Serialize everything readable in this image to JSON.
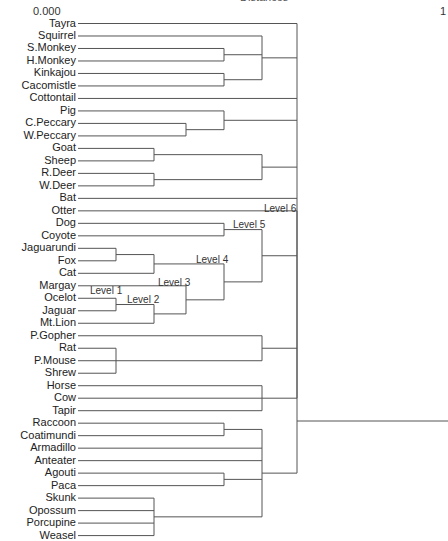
{
  "title": "Distances",
  "axis": {
    "min_label": "0.000",
    "max_label": "1"
  },
  "leaves": [
    "Tayra",
    "Squirrel",
    "S.Monkey",
    "H.Monkey",
    "Kinkajou",
    "Cacomistle",
    "Cottontail",
    "Pig",
    "C.Peccary",
    "W.Peccary",
    "Goat",
    "Sheep",
    "R.Deer",
    "W.Deer",
    "Bat",
    "Otter",
    "Dog",
    "Coyote",
    "Jaguarundi",
    "Fox",
    "Cat",
    "Margay",
    "Ocelot",
    "Jaguar",
    "Mt.Lion",
    "P.Gopher",
    "Rat",
    "P.Mouse",
    "Shrew",
    "Horse",
    "Cow",
    "Tapir",
    "Raccoon",
    "Coatimundi",
    "Armadillo",
    "Anteater",
    "Agouti",
    "Paca",
    "Skunk",
    "Opossum",
    "Porcupine",
    "Weasel"
  ],
  "level_labels": [
    "Level 1",
    "Level 2",
    "Level 3",
    "Level 4",
    "Level 5",
    "Level 6"
  ],
  "chart_data": {
    "type": "dendrogram",
    "title": "Distances",
    "orientation": "horizontal",
    "xlim": [
      0.0,
      1.0
    ],
    "leaves_top_to_bottom": [
      "Tayra",
      "Squirrel",
      "S.Monkey",
      "H.Monkey",
      "Kinkajou",
      "Cacomistle",
      "Cottontail",
      "Pig",
      "C.Peccary",
      "W.Peccary",
      "Goat",
      "Sheep",
      "R.Deer",
      "W.Deer",
      "Bat",
      "Otter",
      "Dog",
      "Coyote",
      "Jaguarundi",
      "Fox",
      "Cat",
      "Margay",
      "Ocelot",
      "Jaguar",
      "Mt.Lion",
      "P.Gopher",
      "Rat",
      "P.Mouse",
      "Shrew",
      "Horse",
      "Cow",
      "Tapir",
      "Raccoon",
      "Coatimundi",
      "Armadillo",
      "Anteater",
      "Agouti",
      "Paca",
      "Skunk",
      "Opossum",
      "Porcupine",
      "Weasel"
    ],
    "annotations": [
      {
        "text": "Level 1",
        "node": "Ocelot+Jaguar"
      },
      {
        "text": "Level 2",
        "node": "(Ocelot,Jaguar)+Mt.Lion"
      },
      {
        "text": "Level 3",
        "node": "Margay+((Ocelot,Jaguar),Mt.Lion)"
      },
      {
        "text": "Level 4",
        "node": "((Jaguarundi,Fox),Cat)+felid cluster"
      },
      {
        "text": "Level 5",
        "node": "(Dog,Coyote)+Level 4 cluster"
      },
      {
        "text": "Level 6",
        "node": "Otter"
      }
    ]
  }
}
